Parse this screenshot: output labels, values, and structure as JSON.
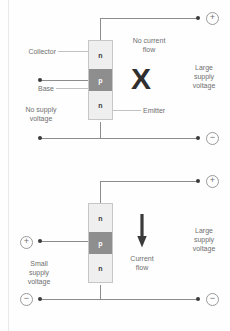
{
  "diagram": {
    "colors": {
      "wire": "#8c8c8c",
      "n_layer": "#efefef",
      "p_layer": "#8e8e8e",
      "label_text": "#6f6f6f",
      "symbol": "#2f2f2f",
      "background": "#fefefe"
    }
  },
  "panels": [
    {
      "id": "off-state",
      "transistor": {
        "layers": [
          {
            "type": "n",
            "label": "n"
          },
          {
            "type": "p",
            "label": "p"
          },
          {
            "type": "n",
            "label": "n"
          }
        ]
      },
      "labels": {
        "collector": "Collector",
        "base": "Base",
        "emitter": "Emitter",
        "state": "No current\nflow",
        "left_supply": "No supply\nvoltage",
        "right_supply": "Large\nsupply\nvoltage"
      },
      "symbol": "X",
      "terminals": {
        "top_right": "+",
        "bottom_right": "−"
      }
    },
    {
      "id": "on-state",
      "transistor": {
        "layers": [
          {
            "type": "n",
            "label": "n"
          },
          {
            "type": "p",
            "label": "p"
          },
          {
            "type": "n",
            "label": "n"
          }
        ]
      },
      "labels": {
        "state": "Current\nflow",
        "left_supply": "Small\nsupply\nvoltage",
        "right_supply": "Large\nsupply\nvoltage"
      },
      "symbol": "arrow-down",
      "terminals": {
        "top_right": "+",
        "bottom_right": "−",
        "left_base": "+",
        "bottom_left": "−"
      }
    }
  ]
}
